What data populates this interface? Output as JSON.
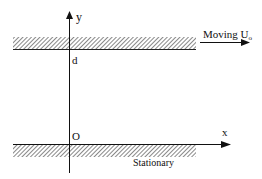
{
  "diagram": {
    "axes": {
      "y_label": "y",
      "x_label": "x",
      "origin_label": "O",
      "gap_label": "d"
    },
    "plates": {
      "top": {
        "label": "Moving U",
        "subscript": "o"
      },
      "bottom": {
        "label": "Stationary"
      }
    },
    "colors": {
      "line": "#111111",
      "hatch": "#444444",
      "background": "#ffffff"
    }
  }
}
